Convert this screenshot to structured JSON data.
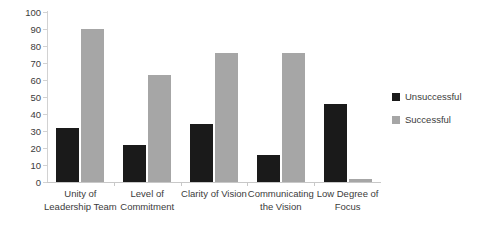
{
  "chart_data": {
    "type": "bar",
    "title": "",
    "subtitle": "",
    "xlabel": "",
    "ylabel": "",
    "ylim": [
      0,
      100
    ],
    "ytick_step": 10,
    "yticks": [
      "0",
      "10",
      "20",
      "30",
      "40",
      "50",
      "60",
      "70",
      "80",
      "90",
      "100"
    ],
    "grid": false,
    "legend_position": "right",
    "categories": [
      "Unity of\nLeadership Team",
      "Level of\nCommitment",
      "Clarity of Vision",
      "Communicating\nthe Vision",
      "Low Degree of\nFocus"
    ],
    "series": [
      {
        "name": "Unsuccessful",
        "color": "#1a1a1a",
        "values": [
          32,
          22,
          34,
          16,
          46
        ]
      },
      {
        "name": "Successful",
        "color": "#a6a6a6",
        "values": [
          90,
          63,
          76,
          76,
          2
        ]
      }
    ]
  },
  "axis": {
    "y": {
      "labels": [
        "100",
        "90",
        "80",
        "70",
        "60",
        "50",
        "40",
        "30",
        "20",
        "10",
        "0"
      ]
    },
    "x": {
      "labels": [
        {
          "line1": "Unity of",
          "line2": "Leadership Team"
        },
        {
          "line1": "Level of",
          "line2": "Commitment"
        },
        {
          "line1": "Clarity of Vision",
          "line2": ""
        },
        {
          "line1": "Communicating",
          "line2": "the Vision"
        },
        {
          "line1": "Low Degree of",
          "line2": "Focus"
        }
      ]
    }
  },
  "legend": {
    "items": [
      {
        "label": "Unsuccessful",
        "color": "#1a1a1a",
        "swatch": "legend-swatch-dark"
      },
      {
        "label": "Successful",
        "color": "#a6a6a6",
        "swatch": "legend-swatch-light"
      }
    ]
  },
  "colors": {
    "unsuccessful": "#1a1a1a",
    "successful": "#a6a6a6",
    "axis": "#c8c8c8",
    "text": "#3b3b3b",
    "background": "#ffffff"
  }
}
